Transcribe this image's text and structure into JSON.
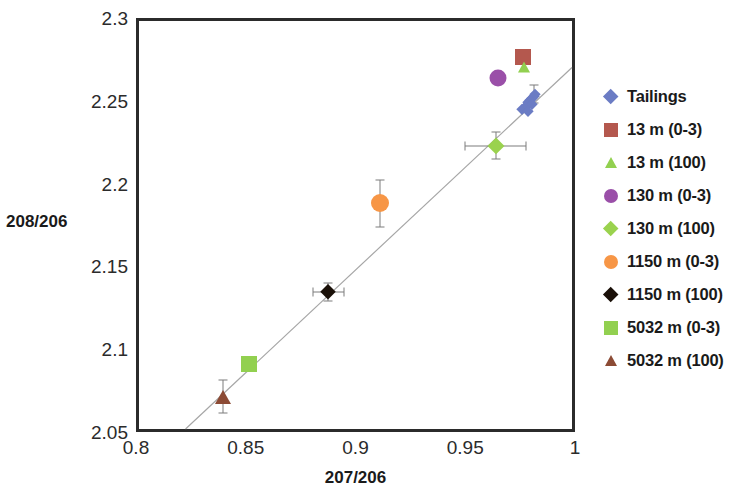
{
  "chart_data": {
    "type": "scatter",
    "title": "",
    "xlabel": "207/206",
    "ylabel": "208/206",
    "xlim": [
      0.8,
      1.0
    ],
    "ylim": [
      2.05,
      2.3
    ],
    "xticks": [
      "0.8",
      "0.85",
      "0.9",
      "0.95",
      "1"
    ],
    "xtick_values": [
      0.8,
      0.85,
      0.9,
      0.95,
      1.0
    ],
    "yticks": [
      "2.05",
      "2.1",
      "2.15",
      "2.2",
      "2.25",
      "2.3"
    ],
    "ytick_values": [
      2.05,
      2.1,
      2.15,
      2.2,
      2.25,
      2.3
    ],
    "grid": false,
    "legend_position": "right",
    "trendline": {
      "name": "regression-line",
      "color": "#a6a6a6",
      "x0": 0.8215,
      "y0": 2.05,
      "x1": 1.0,
      "y1": 2.2715
    },
    "series": [
      {
        "name": "Tailings",
        "marker": "diamond",
        "color": "#6b7cc4",
        "size": 10,
        "points": [
          {
            "x": 0.9745,
            "y": 2.2468
          },
          {
            "x": 0.9758,
            "y": 2.2482
          },
          {
            "x": 0.9766,
            "y": 2.2495
          },
          {
            "x": 0.9774,
            "y": 2.251
          },
          {
            "x": 0.9782,
            "y": 2.2522
          },
          {
            "x": 0.979,
            "y": 2.2535
          },
          {
            "x": 0.9798,
            "y": 2.2548
          },
          {
            "x": 0.9806,
            "y": 2.256
          },
          {
            "x": 0.979,
            "y": 2.25
          },
          {
            "x": 0.977,
            "y": 2.2455
          }
        ],
        "yerr": [
          {
            "x": 0.98,
            "y": 2.256,
            "err": 0.0055
          }
        ]
      },
      {
        "name": "13 m (0-3)",
        "marker": "square",
        "color": "#b4584e",
        "size": 16,
        "points": [
          {
            "x": 0.9748,
            "y": 2.278
          }
        ]
      },
      {
        "name": "13 m (100)",
        "marker": "triangle",
        "color": "#92d050",
        "size": 13,
        "points": [
          {
            "x": 0.9755,
            "y": 2.2722
          }
        ]
      },
      {
        "name": "130 m (0-3)",
        "marker": "circle",
        "color": "#9a4fa8",
        "size": 17,
        "points": [
          {
            "x": 0.9635,
            "y": 2.2655
          }
        ]
      },
      {
        "name": "130 m (100)",
        "marker": "diamond",
        "color": "#9ad24e",
        "size": 16,
        "points": [
          {
            "x": 0.9625,
            "y": 2.2248
          }
        ],
        "xerr": 0.014,
        "yerr_val": 0.0082
      },
      {
        "name": "1150 m (0-3)",
        "marker": "circle",
        "color": "#f79646",
        "size": 18,
        "points": [
          {
            "x": 0.91,
            "y": 2.1898
          }
        ],
        "yerr_val": 0.014
      },
      {
        "name": "1150 m (100)",
        "marker": "diamond",
        "color": "#1a1008",
        "size": 15,
        "points": [
          {
            "x": 0.8862,
            "y": 2.1362
          }
        ],
        "xerr": 0.007,
        "yerr_val": 0.0053
      },
      {
        "name": "5032 m (0-3)",
        "marker": "square",
        "color": "#92d050",
        "size": 16,
        "points": [
          {
            "x": 0.8502,
            "y": 2.093
          }
        ]
      },
      {
        "name": "5032 m (100)",
        "marker": "triangle",
        "color": "#8c4b35",
        "size": 16,
        "points": [
          {
            "x": 0.8382,
            "y": 2.0732
          }
        ],
        "yerr_val": 0.01
      }
    ]
  },
  "legend": {
    "items": [
      {
        "label": "Tailings",
        "marker": "diamond",
        "color": "#6b7cc4"
      },
      {
        "label": "13 m (0-3)",
        "marker": "square",
        "color": "#b4584e"
      },
      {
        "label": "13 m (100)",
        "marker": "triangle",
        "color": "#92d050"
      },
      {
        "label": "130 m (0-3)",
        "marker": "circle",
        "color": "#9a4fa8"
      },
      {
        "label": "130 m (100)",
        "marker": "diamond",
        "color": "#9ad24e"
      },
      {
        "label": "1150 m (0-3)",
        "marker": "circle",
        "color": "#f79646"
      },
      {
        "label": "1150 m (100)",
        "marker": "diamond",
        "color": "#1a1008"
      },
      {
        "label": "5032 m (0-3)",
        "marker": "square",
        "color": "#92d050"
      },
      {
        "label": "5032 m (100)",
        "marker": "triangle",
        "color": "#8c4b35"
      }
    ]
  }
}
